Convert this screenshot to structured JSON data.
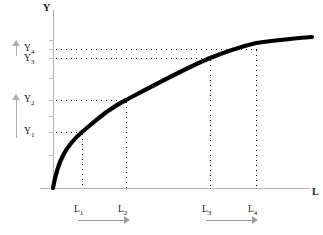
{
  "chart_data": {
    "type": "line",
    "title": "",
    "subtitle": "",
    "xlabel": "L",
    "ylabel": "Y",
    "grid": false,
    "legend": null,
    "axis": {
      "x_title": "L",
      "y_title": "Y",
      "xlim": [
        0,
        10
      ],
      "ylim": [
        0,
        10
      ]
    },
    "x_tick_labels": [
      "L₁",
      "L₂",
      "L₃",
      "L₄"
    ],
    "y_tick_labels": [
      "Y₁",
      "Y₂",
      "Y₃",
      "Y₄"
    ],
    "points": [
      {
        "x_label": "L₁",
        "y_label": "Y₁",
        "x_px": 82,
        "y_px": 132
      },
      {
        "x_label": "L₂",
        "y_label": "Y₂",
        "x_px": 126,
        "y_px": 100
      },
      {
        "x_label": "L₃",
        "y_label": "Y₃",
        "x_px": 210,
        "y_px": 58
      },
      {
        "x_label": "L₄",
        "y_label": "Y₄",
        "x_px": 256,
        "y_px": 49
      }
    ],
    "curve_path": "M 53 188 C 58 160, 66 146, 82 132 C 100 117, 110 108, 126 100 C 160 82, 186 68, 210 58 C 230 50, 244 46, 256 43 C 278 40, 298 38, 312 37",
    "annotations": [
      {
        "name": "y-gap-upper",
        "kind": "up-arrow",
        "spans": "Y₃ to Y₄",
        "meaning": "smaller output gain"
      },
      {
        "name": "y-gap-lower",
        "kind": "up-arrow",
        "spans": "Y₁ to Y₂",
        "meaning": "larger output gain"
      },
      {
        "name": "l-gap-lower",
        "kind": "right-arrow",
        "spans": "L₁ to L₂",
        "meaning": "equal labour increment"
      },
      {
        "name": "l-gap-upper",
        "kind": "right-arrow",
        "spans": "L₃ to L₄",
        "meaning": "equal labour increment"
      }
    ],
    "colors": {
      "curve": "#000000",
      "guides": "#000000",
      "axis": "#b4b4b4",
      "arrow": "#a8a8a8",
      "background": "#ffffff",
      "label": "#141414"
    }
  },
  "labels": {
    "y_axis_title": "Y",
    "x_axis_title": "L",
    "y1": "Y",
    "y1_sub": "1",
    "y2": "Y",
    "y2_sub": "2",
    "y3": "Y",
    "y3_sub": "3",
    "y4": "Y",
    "y4_sub": "4",
    "l1": "L",
    "l1_sub": "1",
    "l2": "L",
    "l2_sub": "2",
    "l3": "L",
    "l3_sub": "3",
    "l4": "L",
    "l4_sub": "4"
  }
}
